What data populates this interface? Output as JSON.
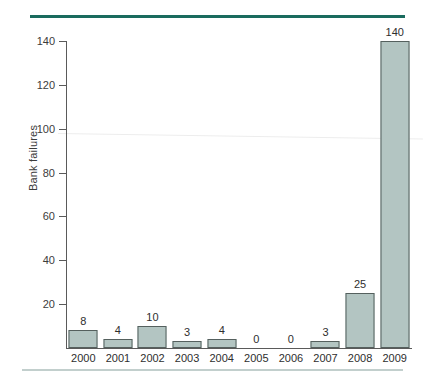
{
  "decor": {
    "rule_top_color": "#1a6b5e",
    "rule_bottom_color": "#c2cfcd"
  },
  "chart_data": {
    "type": "bar",
    "title": "",
    "subtitle": "",
    "xlabel": "",
    "ylabel": "Bank failures",
    "categories": [
      "2000",
      "2001",
      "2002",
      "2003",
      "2004",
      "2005",
      "2006",
      "2007",
      "2008",
      "2009"
    ],
    "values": [
      8,
      4,
      10,
      3,
      4,
      0,
      0,
      3,
      25,
      140
    ],
    "data_labels": [
      "8",
      "4",
      "10",
      "3",
      "4",
      "0",
      "0",
      "3",
      "25",
      "140"
    ],
    "ylim": [
      0,
      140
    ],
    "yticks": [
      20,
      40,
      60,
      80,
      100,
      120,
      140
    ],
    "ytick_labels": [
      "20",
      "40",
      "60",
      "80",
      "100",
      "120",
      "140"
    ],
    "grid": false,
    "legend": false,
    "legend_position": "none",
    "bar_fill_color": "#b3c5c2",
    "bar_border_color": "#55605e",
    "axis_color": "#5a5a5a",
    "text_color": "#2e2e2e",
    "background_color": "#ffffff"
  }
}
